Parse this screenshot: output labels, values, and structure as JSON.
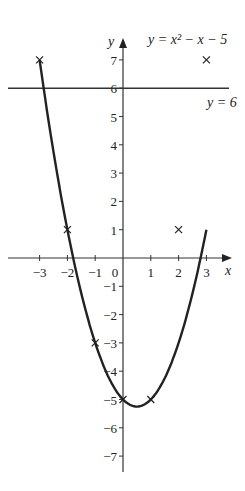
{
  "chart_data": {
    "type": "line",
    "title": "",
    "xlabel": "x",
    "ylabel": "y",
    "xlim": [
      -3.5,
      3.5
    ],
    "ylim": [
      -7.5,
      7.5
    ],
    "x_ticks": [
      -3,
      -2,
      -1,
      0,
      1,
      2,
      3
    ],
    "y_ticks": [
      -7,
      -6,
      -5,
      -4,
      -3,
      -2,
      -1,
      1,
      2,
      3,
      4,
      5,
      6,
      7
    ],
    "series": [
      {
        "name": "y = x^2 - x - 5",
        "x": [
          -3,
          -2,
          -1,
          0,
          1,
          2,
          3
        ],
        "y": [
          7,
          1,
          -3,
          -5,
          -5,
          -3,
          1
        ],
        "marker": "x",
        "marked_points": [
          [
            -3,
            7
          ],
          [
            -2,
            1
          ],
          [
            -1,
            -3
          ],
          [
            0,
            -5
          ],
          [
            1,
            -5
          ],
          [
            2,
            1
          ],
          [
            3,
            7
          ]
        ]
      },
      {
        "name": "y = 6",
        "x": [
          -3.5,
          3.5
        ],
        "y": [
          6,
          6
        ]
      }
    ],
    "annotations": [
      "y = x² − x − 5",
      "y = 6"
    ]
  },
  "labels": {
    "curve": "y = x² − x − 5",
    "line": "y = 6",
    "x_axis": "x",
    "y_axis": "y"
  }
}
